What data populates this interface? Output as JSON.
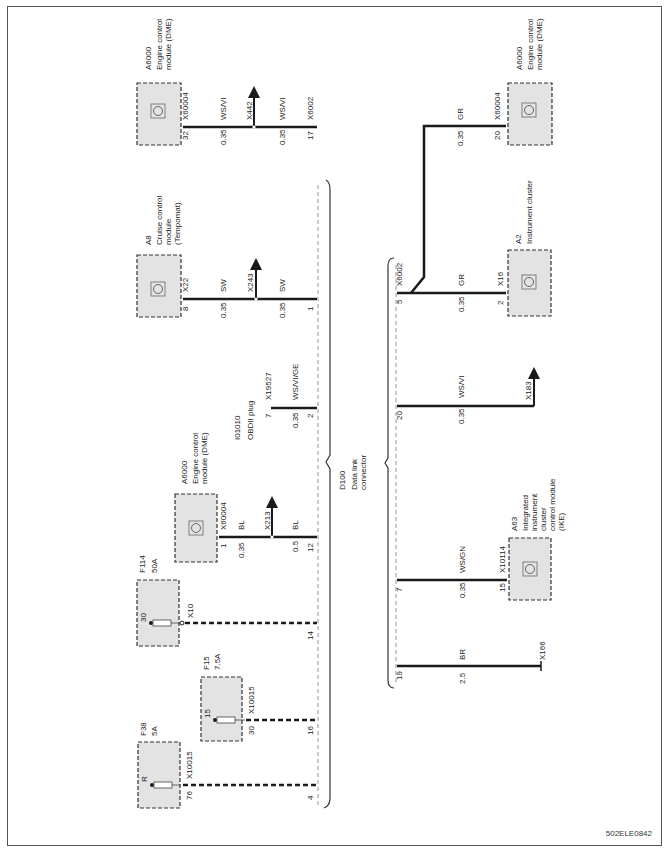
{
  "diagram": {
    "orientation": "rotated-90-ccw",
    "figure_id": "502ELE0842",
    "connector": {
      "id": "D100",
      "name_line1": "Data link",
      "name_line2": "connector"
    },
    "left_group": {
      "bus_connector": "X6002",
      "branches": [
        {
          "component_id": "A6000",
          "component_name_line1": "Engine control",
          "component_name_line2": "module (DME)",
          "component_pin": "32",
          "component_connector": "X60004",
          "wire_size_a": "0.35",
          "wire_color_a": "WS/VI",
          "splice": "X442",
          "wire_size_b": "0.35",
          "wire_color_b": "WS/VI",
          "bus_pin": "17",
          "bus_connector": "X6002"
        },
        {
          "component_id": "A8",
          "component_name_line1": "Cruise control",
          "component_name_line2": "module",
          "component_name_line3": "(Tempomat)",
          "component_pin": "8",
          "component_connector": "X22",
          "wire_size_a": "0.35",
          "wire_color_a": "SW",
          "splice": "X243",
          "wire_size_b": "0.35",
          "wire_color_b": "SW",
          "bus_pin": "1"
        },
        {
          "component_id": "I01010",
          "component_name_line1": "OBDII plug",
          "component_pin": "7",
          "component_connector": "X19527",
          "wire_size_a": "0.35",
          "wire_color_a": "WS/VI/GE",
          "bus_pin": "2"
        },
        {
          "component_id": "A6000",
          "component_name_line1": "Engine control",
          "component_name_line2": "module (DME)",
          "component_pin": "1",
          "component_connector": "X60004",
          "wire_size_a": "0.35",
          "wire_color_a": "BL",
          "splice": "X213",
          "wire_size_b": "0.5",
          "wire_color_b": "BL",
          "bus_pin": "12"
        },
        {
          "component_id": "F114",
          "component_name_line1": "50A",
          "fuse_pin": "30",
          "component_connector": "X10",
          "bus_pin": "14"
        },
        {
          "component_id": "F15",
          "component_name_line1": "7.5A",
          "fuse_pin": "15",
          "component_pin": "30",
          "component_connector": "X10015",
          "bus_pin": "16"
        },
        {
          "component_id": "F38",
          "component_name_line1": "5A",
          "fuse_pin": "R",
          "component_pin": "76",
          "component_connector": "X10015",
          "bus_pin": "4"
        }
      ]
    },
    "right_group": {
      "bus_connector": "X6002",
      "branches": [
        {
          "component_id": "A6000",
          "component_name_line1": "Engine control",
          "component_name_line2": "module (DME)",
          "component_pin": "20",
          "component_connector": "X60004",
          "wire_size": "0.35",
          "wire_color": "GR"
        },
        {
          "component_id": "A2",
          "component_name_line1": "Instrument cluster",
          "component_pin": "2",
          "component_connector": "X16",
          "wire_size": "0.35",
          "wire_color": "GR",
          "bus_pin": "5",
          "bus_connector": "X6002"
        },
        {
          "component_id": "X183",
          "wire_size": "0.35",
          "wire_color": "WS/VI",
          "bus_pin": "20"
        },
        {
          "component_id": "A63",
          "component_name_line1": "Integrated",
          "component_name_line2": "instrument",
          "component_name_line3": "cluster",
          "component_name_line4": "control module",
          "component_name_line5": "(IKE)",
          "component_pin": "15",
          "component_connector": "X10114",
          "wire_size": "0.35",
          "wire_color": "WS/GN",
          "bus_pin": "7"
        },
        {
          "component_id": "X166",
          "wire_size": "2.5",
          "wire_color": "BR",
          "bus_pin": "19"
        }
      ]
    },
    "colors": {
      "wire": "#1a1a1a",
      "component_fill": "#e3e3e3",
      "component_border": "#333333",
      "dashed_bus": "#777777",
      "frame": "#555555"
    }
  }
}
